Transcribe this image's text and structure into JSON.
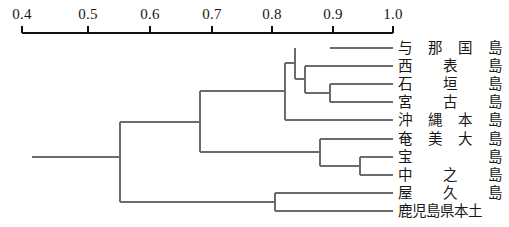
{
  "figure": {
    "type": "dendrogram",
    "title": "",
    "background_color": "#ffffff",
    "line_color": "#6b6b6b",
    "axis_color": "#111111"
  },
  "axis": {
    "orientation": "top",
    "min": 0.4,
    "max": 1.0,
    "ticks": [
      {
        "value": "0.4",
        "x": 22
      },
      {
        "value": "0.5",
        "x": 88
      },
      {
        "value": "0.6",
        "x": 150
      },
      {
        "value": "0.7",
        "x": 212
      },
      {
        "value": "0.8",
        "x": 272
      },
      {
        "value": "0.9",
        "x": 333
      },
      {
        "value": "1.0",
        "x": 393
      }
    ]
  },
  "chart_data": {
    "type": "dendrogram",
    "title": "",
    "xlabel": "",
    "ylabel": "",
    "xlim": [
      0.4,
      1.0
    ],
    "grid": false,
    "legend": null,
    "orientation": "horizontal-right-leaves",
    "leaves": [
      {
        "label": "与那国島",
        "chars": [
          "与",
          "那",
          "国",
          "島"
        ],
        "index": 0,
        "y": 48
      },
      {
        "label": "西表島",
        "chars": [
          "西",
          "表",
          "島"
        ],
        "index": 1,
        "y": 66
      },
      {
        "label": "石垣島",
        "chars": [
          "石",
          "垣",
          "島"
        ],
        "index": 2,
        "y": 84
      },
      {
        "label": "宮古島",
        "chars": [
          "宮",
          "古",
          "島"
        ],
        "index": 3,
        "y": 102
      },
      {
        "label": "沖縄本島",
        "chars": [
          "沖",
          "縄",
          "本",
          "島"
        ],
        "index": 4,
        "y": 120
      },
      {
        "label": "奄美大島",
        "chars": [
          "奄",
          "美",
          "大",
          "島"
        ],
        "index": 5,
        "y": 139
      },
      {
        "label": "宝島",
        "chars": [
          "宝",
          "島"
        ],
        "index": 6,
        "y": 157
      },
      {
        "label": "中之島",
        "chars": [
          "中",
          "之",
          "島"
        ],
        "index": 7,
        "y": 175
      },
      {
        "label": "屋久島",
        "chars": [
          "屋",
          "久",
          "島"
        ],
        "index": 8,
        "y": 193
      },
      {
        "label": "鹿児島県本土",
        "chars": [
          "鹿",
          "児",
          "島",
          "県",
          "本",
          "土"
        ],
        "index": 9,
        "y": 211,
        "tight": true
      }
    ],
    "merges": [
      {
        "id": "m1",
        "members": [
          "石垣島",
          "宮古島"
        ],
        "height": 0.898,
        "x": 330
      },
      {
        "id": "m2",
        "members": [
          "西表島",
          "石垣島",
          "宮古島"
        ],
        "height": 0.858,
        "x": 305
      },
      {
        "id": "m3",
        "members": [
          "与那国島",
          "西表島",
          "石垣島",
          "宮古島"
        ],
        "height": 0.842,
        "x": 295
      },
      {
        "id": "m4",
        "members": [
          "与那国島",
          "西表島",
          "石垣島",
          "宮古島",
          "沖縄本島"
        ],
        "height": 0.826,
        "x": 285
      },
      {
        "id": "m5",
        "members": [
          "宝島",
          "中之島"
        ],
        "height": 0.947,
        "x": 360
      },
      {
        "id": "m6",
        "members": [
          "奄美大島",
          "宝島",
          "中之島"
        ],
        "height": 0.883,
        "x": 320
      },
      {
        "id": "m7",
        "members": [
          "屋久島",
          "鹿児島県本土"
        ],
        "height": 0.809,
        "x": 275
      },
      {
        "id": "m8",
        "members": [
          "ryukyu",
          "amami"
        ],
        "height": 0.688,
        "x": 200
      },
      {
        "id": "root",
        "members": [
          "all"
        ],
        "height": 0.559,
        "x": 120
      }
    ],
    "root_stub_x": 32,
    "leaf_tip_x": 393
  }
}
